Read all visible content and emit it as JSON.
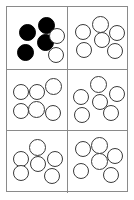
{
  "figure": {
    "rows": 3,
    "columns": 2,
    "panel_count": 6,
    "circles_per_panel": 6
  },
  "colors": {
    "background": "#ffffff",
    "grid_line": "#8a8a8a",
    "circle_outline": "#3a3a3a",
    "circle_open_fill": "#ffffff",
    "circle_filled_fill": "#000000"
  },
  "panels": [
    {
      "id": "panel-1",
      "position": "top-left",
      "row": 1,
      "column": 1,
      "total_circles": 6,
      "filled_circles": 4,
      "open_circles": 2,
      "circles": [
        {
          "fill": "filled",
          "x": 12,
          "y": 17,
          "d": 17
        },
        {
          "fill": "filled",
          "x": 31,
          "y": 10,
          "d": 17
        },
        {
          "fill": "filled",
          "x": 30,
          "y": 27,
          "d": 17
        },
        {
          "fill": "filled",
          "x": 10,
          "y": 37,
          "d": 17
        },
        {
          "fill": "open",
          "x": 42,
          "y": 21,
          "d": 16
        },
        {
          "fill": "open",
          "x": 41,
          "y": 40,
          "d": 16
        }
      ]
    },
    {
      "id": "panel-2",
      "position": "top-right",
      "row": 1,
      "column": 2,
      "total_circles": 6,
      "filled_circles": 0,
      "open_circles": 6,
      "circles": [
        {
          "fill": "open",
          "x": 7,
          "y": 17,
          "d": 16
        },
        {
          "fill": "open",
          "x": 24,
          "y": 9,
          "d": 17
        },
        {
          "fill": "open",
          "x": 41,
          "y": 18,
          "d": 16
        },
        {
          "fill": "open",
          "x": 26,
          "y": 25,
          "d": 16
        },
        {
          "fill": "open",
          "x": 8,
          "y": 35,
          "d": 16
        },
        {
          "fill": "open",
          "x": 39,
          "y": 36,
          "d": 16
        }
      ]
    },
    {
      "id": "panel-3",
      "position": "middle-left",
      "row": 2,
      "column": 1,
      "total_circles": 6,
      "filled_circles": 0,
      "open_circles": 6,
      "circles": [
        {
          "fill": "open",
          "x": 6,
          "y": 14,
          "d": 16
        },
        {
          "fill": "open",
          "x": 22,
          "y": 14,
          "d": 16
        },
        {
          "fill": "open",
          "x": 38,
          "y": 8,
          "d": 17
        },
        {
          "fill": "open",
          "x": 6,
          "y": 33,
          "d": 16
        },
        {
          "fill": "open",
          "x": 21,
          "y": 31,
          "d": 17
        },
        {
          "fill": "open",
          "x": 38,
          "y": 35,
          "d": 16
        }
      ]
    },
    {
      "id": "panel-4",
      "position": "middle-right",
      "row": 2,
      "column": 2,
      "total_circles": 6,
      "filled_circles": 0,
      "open_circles": 6,
      "circles": [
        {
          "fill": "open",
          "x": 22,
          "y": 6,
          "d": 17
        },
        {
          "fill": "open",
          "x": 41,
          "y": 16,
          "d": 16
        },
        {
          "fill": "open",
          "x": 5,
          "y": 19,
          "d": 16
        },
        {
          "fill": "open",
          "x": 24,
          "y": 24,
          "d": 16
        },
        {
          "fill": "open",
          "x": 6,
          "y": 37,
          "d": 16
        },
        {
          "fill": "open",
          "x": 35,
          "y": 35,
          "d": 16
        }
      ]
    },
    {
      "id": "panel-5",
      "position": "bottom-left",
      "row": 3,
      "column": 1,
      "total_circles": 6,
      "filled_circles": 0,
      "open_circles": 6,
      "circles": [
        {
          "fill": "open",
          "x": 22,
          "y": 8,
          "d": 17
        },
        {
          "fill": "open",
          "x": 6,
          "y": 20,
          "d": 16
        },
        {
          "fill": "open",
          "x": 40,
          "y": 20,
          "d": 16
        },
        {
          "fill": "open",
          "x": 23,
          "y": 25,
          "d": 16
        },
        {
          "fill": "open",
          "x": 6,
          "y": 34,
          "d": 16
        },
        {
          "fill": "open",
          "x": 37,
          "y": 37,
          "d": 16
        }
      ]
    },
    {
      "id": "panel-6",
      "position": "bottom-right",
      "row": 3,
      "column": 2,
      "total_circles": 6,
      "filled_circles": 0,
      "open_circles": 6,
      "circles": [
        {
          "fill": "open",
          "x": 7,
          "y": 10,
          "d": 16
        },
        {
          "fill": "open",
          "x": 23,
          "y": 6,
          "d": 17
        },
        {
          "fill": "open",
          "x": 39,
          "y": 17,
          "d": 16
        },
        {
          "fill": "open",
          "x": 23,
          "y": 22,
          "d": 17
        },
        {
          "fill": "open",
          "x": 5,
          "y": 32,
          "d": 16
        },
        {
          "fill": "open",
          "x": 35,
          "y": 36,
          "d": 16
        }
      ]
    }
  ]
}
